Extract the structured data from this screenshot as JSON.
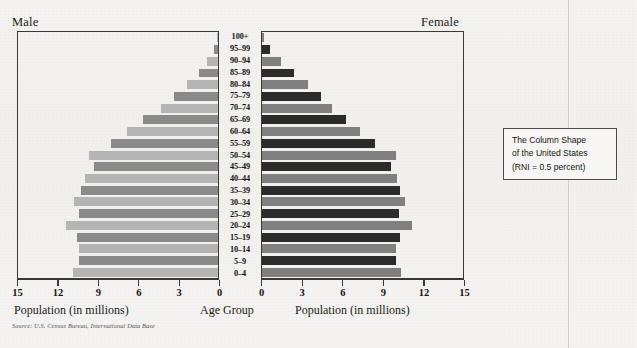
{
  "figure": {
    "male_label": "Male",
    "female_label": "Female",
    "age_axis_title": "Age Group",
    "source_note": "Source: U.S. Census Bureau, International Data Base"
  },
  "callout": {
    "line1": "The Column Shape",
    "line2": "of the United States",
    "line3": "(RNI = 0.5 percent)"
  },
  "colors": {
    "male_dark": "#8a8a8a",
    "male_light": "#b4b4b4",
    "female_dark": "#2b2b2b",
    "female_light": "#808080",
    "frame": "#3a3933",
    "paper": "#f3f2f0"
  },
  "chart_data": {
    "type": "bar",
    "subtitle": "The Column Shape of the United States (RNI = 0.5 percent)",
    "orientation": "horizontal-pyramid",
    "xlabel": "Population (in millions)",
    "ylabel": "Age Group",
    "xlim": [
      0,
      15
    ],
    "xticks": [
      0,
      3,
      6,
      9,
      12,
      15
    ],
    "male_xticks": [
      "15",
      "12",
      "9",
      "6",
      "3",
      "0"
    ],
    "female_xticks": [
      "0",
      "3",
      "6",
      "9",
      "12",
      "15"
    ],
    "grid": false,
    "legend": [
      "Male",
      "Female"
    ],
    "categories": [
      "100+",
      "95-99",
      "90-94",
      "85-89",
      "80-84",
      "75-79",
      "70-74",
      "65-69",
      "60-64",
      "55-59",
      "50-54",
      "45-49",
      "40-44",
      "35-39",
      "30-34",
      "25-29",
      "20-24",
      "15-19",
      "10-14",
      "5-9",
      "0-4"
    ],
    "series": [
      {
        "name": "Male",
        "axis": "left-reversed",
        "values": [
          0.05,
          0.3,
          0.8,
          1.4,
          2.3,
          3.3,
          4.3,
          5.6,
          6.8,
          8.0,
          9.7,
          9.3,
          10.0,
          10.3,
          10.8,
          10.4,
          11.4,
          10.6,
          10.4,
          10.4,
          10.9
        ]
      },
      {
        "name": "Female",
        "axis": "right",
        "values": [
          0.15,
          0.6,
          1.4,
          2.4,
          3.4,
          4.4,
          5.2,
          6.3,
          7.3,
          8.4,
          10.0,
          9.6,
          10.1,
          10.3,
          10.7,
          10.2,
          11.2,
          10.3,
          10.0,
          10.0,
          10.4
        ]
      }
    ]
  }
}
